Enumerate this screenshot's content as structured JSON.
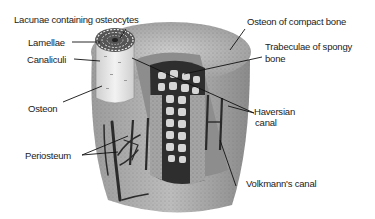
{
  "diagram": {
    "title_cutoff": "",
    "labels": {
      "lacunae": "Lacunae containing osteocytes",
      "lamellae": "Lamellae",
      "canaliculi": "Canaliculi",
      "osteon": "Osteon",
      "periosteum": "Periosteum",
      "osteon_compact": "Osteon of compact bone",
      "trabeculae_line1": "Trabeculae of  spongy",
      "trabeculae_line2": "bone",
      "haversian_line1": "Haversian",
      "haversian_line2": "canal",
      "volkmann": "Volkmann's canal"
    },
    "colors": {
      "background": "#ffffff",
      "bone_light": "#d8d8d8",
      "bone_mid": "#a8a8a8",
      "bone_dark": "#4a4a4a",
      "leader_line": "#111111"
    }
  }
}
